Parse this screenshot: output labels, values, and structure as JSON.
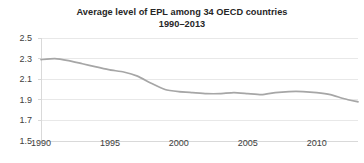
{
  "chart_data": {
    "type": "line",
    "title": "Average level of EPL among 34 OECD countries",
    "subtitle": "1990–2013",
    "xlabel": "",
    "ylabel": "",
    "grid": true,
    "legend": false,
    "legend_position": "none",
    "line_color": "#a6a6a6",
    "axis_color": "#d9d9d9",
    "grid_color": "#e8e8e8",
    "text_color": "#404040",
    "title_color": "#262626",
    "xlim": [
      1990,
      2013
    ],
    "ylim": [
      1.5,
      2.5
    ],
    "y_ticks": [
      2.5,
      2.3,
      2.1,
      1.9,
      1.7,
      1.5
    ],
    "y_tick_labels": [
      "2.5",
      "2.3",
      "2.1",
      "1.9",
      "1.7",
      "1.5"
    ],
    "x_ticks": [
      1990,
      1995,
      2000,
      2005,
      2010
    ],
    "x_tick_labels": [
      "1990",
      "1995",
      "2000",
      "2005",
      "2010"
    ],
    "series": [
      {
        "name": "Average EPL",
        "x": [
          1990,
          1991,
          1992,
          1993,
          1994,
          1995,
          1996,
          1997,
          1998,
          1999,
          2000,
          2001,
          2002,
          2003,
          2004,
          2005,
          2006,
          2007,
          2008,
          2009,
          2010,
          2011,
          2012,
          2013
        ],
        "values": [
          2.29,
          2.3,
          2.28,
          2.25,
          2.22,
          2.19,
          2.17,
          2.13,
          2.06,
          2.0,
          1.98,
          1.97,
          1.96,
          1.96,
          1.97,
          1.96,
          1.95,
          1.97,
          1.98,
          1.98,
          1.97,
          1.95,
          1.91,
          1.88
        ]
      }
    ]
  }
}
